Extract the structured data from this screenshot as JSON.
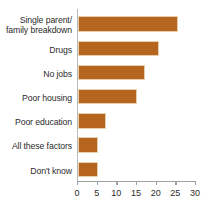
{
  "chart_data": {
    "type": "bar",
    "orientation": "horizontal",
    "title": "",
    "subtitle": "",
    "xlabel": "",
    "ylabel": "",
    "categories": [
      "Single parent/\nfamily breakdown",
      "Drugs",
      "No jobs",
      "Poor housing",
      "Poor education",
      "All these factors",
      "Don't know"
    ],
    "category_lines": [
      [
        "Single parent/",
        "family breakdown"
      ],
      [
        "Drugs"
      ],
      [
        "No jobs"
      ],
      [
        "Poor housing"
      ],
      [
        "Poor education"
      ],
      [
        "All these factors"
      ],
      [
        "Don't know"
      ]
    ],
    "values": [
      25.5,
      20.5,
      17,
      15,
      7,
      5,
      5
    ],
    "xlim": [
      0,
      30
    ],
    "xticks": [
      0,
      5,
      10,
      15,
      20,
      25,
      30
    ],
    "xtick_labels": [
      "0",
      "5",
      "10",
      "15",
      "20",
      "25",
      "30"
    ],
    "grid": false,
    "legend": null,
    "bar_color": "#b5651d",
    "bar_edge_color": "#e8cfae",
    "axis_color": "#9aa0a4",
    "text_color": "#2b2b2b"
  }
}
